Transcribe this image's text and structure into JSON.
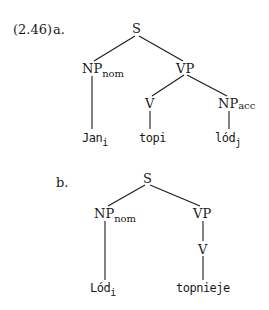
{
  "example": {
    "number": "(2.46)",
    "a": {
      "label": "a.",
      "root": "S",
      "np_nom": {
        "head": "NP",
        "sub": "nom"
      },
      "vp": "VP",
      "v": "V",
      "np_acc": {
        "head": "NP",
        "sub": "acc"
      },
      "leaves": [
        {
          "word": "Jan",
          "index": "i"
        },
        {
          "word": "topi",
          "index": ""
        },
        {
          "word": "lód",
          "index": "j"
        }
      ]
    },
    "b": {
      "label": "b.",
      "root": "S",
      "np_nom": {
        "head": "NP",
        "sub": "nom"
      },
      "vp": "VP",
      "v": "V",
      "leaves": [
        {
          "word": "Lód",
          "index": "i"
        },
        {
          "word": "topnieje",
          "index": ""
        }
      ]
    }
  }
}
